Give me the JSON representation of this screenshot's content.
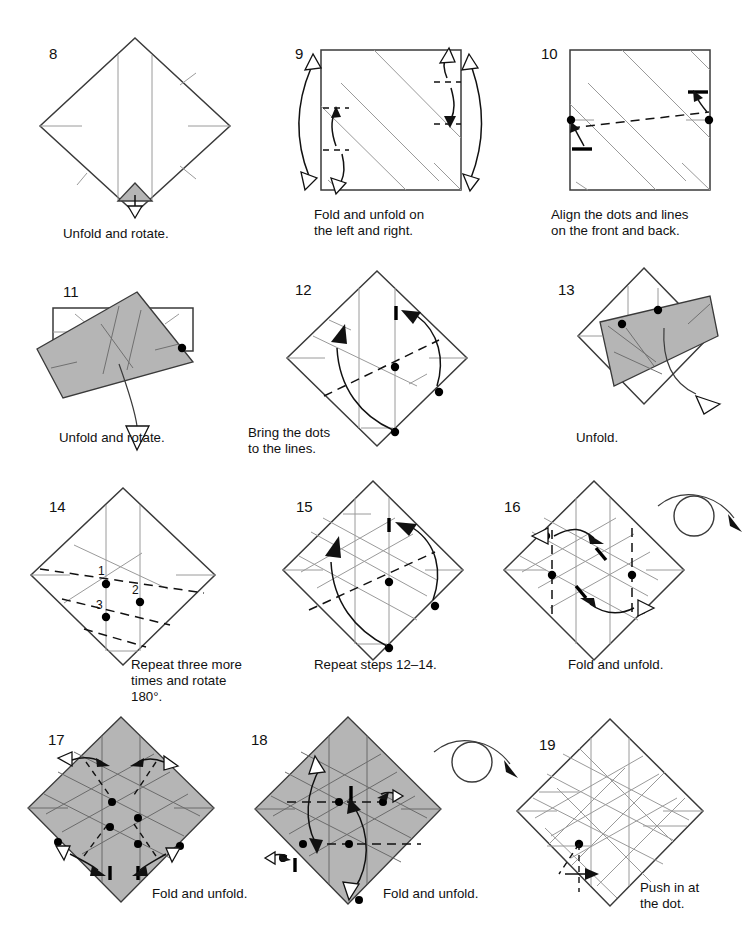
{
  "page": {
    "width": 752,
    "height": 940,
    "background": "#ffffff",
    "kind": "origami-instruction-diagrams",
    "paper_gray": "#b5b5b5",
    "ink": "#1a1a1a"
  },
  "steps": [
    {
      "number": "8",
      "caption": "Unfold and rotate.",
      "shape": "diamond",
      "shaded": false,
      "marks": "vertical creases, small shaded triangle at bottom, hollow unfold arrow",
      "dots": 0
    },
    {
      "number": "9",
      "caption": "Fold and unfold on\nthe left and right.",
      "shape": "square",
      "shaded": false,
      "marks": "diagonal creases, tall double hollow arrows on left and right, short fold arrows",
      "dots": 0
    },
    {
      "number": "10",
      "caption": "Align the dots and lines\non the front and back.",
      "shape": "square",
      "shaded": false,
      "marks": "crossing diagonals, dashed valley line between edge dots, two curved solid arrows",
      "dots": 2
    },
    {
      "number": "11",
      "caption": "Unfold and rotate.",
      "shape": "rotated-flap",
      "shaded": true,
      "marks": "gray folded band over white rectangle, long hollow unfold arrow",
      "dots": 1
    },
    {
      "number": "12",
      "caption": "Bring the dots\nto the lines.",
      "shape": "diamond",
      "shaded": false,
      "marks": "dashed valley line, two long curved solid arrows, thick tick marks",
      "dots": 3
    },
    {
      "number": "13",
      "caption": "Unfold.",
      "shape": "rotated-flap",
      "shaded": true,
      "marks": "gray flap folded across diamond, hollow unfold arrow to the right",
      "dots": 2
    },
    {
      "number": "14",
      "caption": "Repeat three more\ntimes and rotate 180°.",
      "shape": "diamond",
      "shaded": false,
      "marks": "dashed valley lines with numbered dots",
      "dots": 3,
      "dot_labels": [
        "1",
        "2",
        "3"
      ]
    },
    {
      "number": "15",
      "caption": "Repeat steps 12–14.",
      "shape": "diamond",
      "shaded": false,
      "marks": "grid creases, dashed valley line, two long curved solid arrows",
      "dots": 3
    },
    {
      "number": "16",
      "caption": "Fold and unfold.",
      "shape": "diamond",
      "shaded": false,
      "turn_over": true,
      "marks": "vertical dashed valley lines, two horizontal double arrows (one hollow one solid head)",
      "dots": 4
    },
    {
      "number": "17",
      "caption": "Fold and unfold.",
      "shape": "diamond",
      "shaded": true,
      "marks": "grid creases, four short dashed diagonals with double arrows at corners",
      "dots": 6
    },
    {
      "number": "18",
      "caption": "Fold and unfold.",
      "shape": "diamond",
      "shaded": true,
      "turn_over": true,
      "marks": "horizontal dashed valley lines, two long curved arrows with hollow heads",
      "dots": 6
    },
    {
      "number": "19",
      "caption": "Push in at\nthe dot.",
      "shape": "diamond",
      "shaded": false,
      "marks": "dense crease grid, single dot with dashed push-in arrow",
      "dots": 1
    }
  ]
}
